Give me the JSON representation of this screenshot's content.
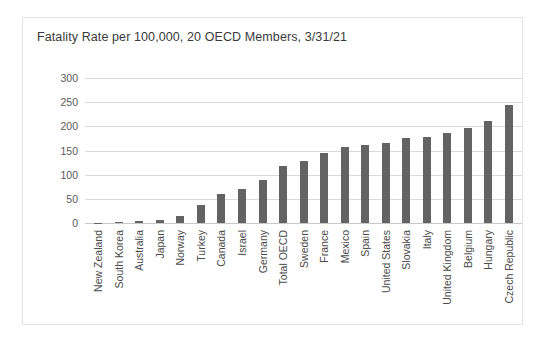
{
  "chart_data": {
    "type": "bar",
    "title": "Fatality Rate per 100,000, 20 OECD Members, 3/31/21",
    "xlabel": "",
    "ylabel": "",
    "ylim": [
      0,
      300
    ],
    "yticks": [
      300,
      250,
      200,
      150,
      100,
      50,
      0
    ],
    "grid": true,
    "legend": "none",
    "bar_color": "#636363",
    "categories": [
      "New Zealand",
      "South Korea",
      "Australia",
      "Japan",
      "Norway",
      "Turkey",
      "Canada",
      "Israel",
      "Germany",
      "Total OECD",
      "Sweden",
      "France",
      "Mexico",
      "Spain",
      "United States",
      "Slovakia",
      "Italy",
      "United Kingdom",
      "Belgium",
      "Hungary",
      "Czech Republic"
    ],
    "values": [
      1,
      2,
      4,
      7,
      14,
      38,
      61,
      70,
      90,
      117,
      129,
      145,
      158,
      161,
      165,
      176,
      178,
      186,
      196,
      211,
      244
    ]
  }
}
